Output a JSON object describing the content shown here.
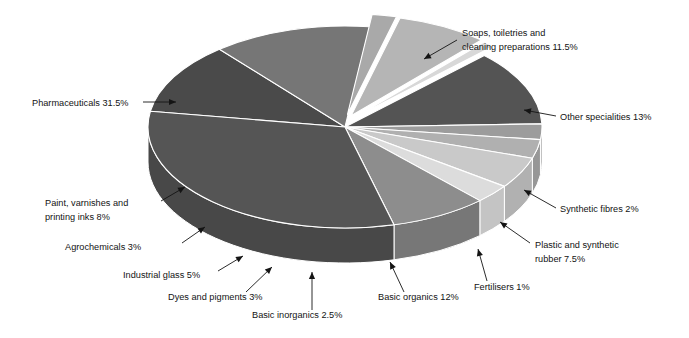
{
  "chart_data": {
    "type": "pie",
    "title": "",
    "subtitle": "",
    "xlabel": "",
    "ylabel": "",
    "style": "3d-exploded-pie",
    "legend_position": "none",
    "grid": false,
    "units": "percent",
    "total": 100,
    "categories": [
      "Soaps, toiletries and cleaning preparations",
      "Other specialities",
      "Synthetic fibres",
      "Plastic and synthetic rubber",
      "Fertilisers",
      "Basic organics",
      "Basic inorganics",
      "Dyes and pigments",
      "Industrial glass",
      "Agrochemicals",
      "Paint, varnishes and printing inks",
      "Pharmaceuticals"
    ],
    "values": [
      11.5,
      13,
      2,
      7.5,
      1,
      12,
      2.5,
      3,
      5,
      3,
      8,
      31.5
    ],
    "slices": [
      {
        "label": "Soaps, toiletries and cleaning preparations 11.5%",
        "name": "Soaps, toiletries and cleaning preparations",
        "value": 11.5,
        "value_text": "11.5%",
        "color": "#4a4a4a",
        "side_color": "#3c3c3c",
        "exploded": false
      },
      {
        "label": "Other specialities 13%",
        "name": "Other specialities",
        "value": 13,
        "value_text": "13%",
        "color": "#767676",
        "side_color": "#606060",
        "exploded": false
      },
      {
        "label": "Synthetic fibres 2%",
        "name": "Synthetic fibres",
        "value": 2,
        "value_text": "2%",
        "color": "#a9a9a9",
        "side_color": "#8e8e8e",
        "exploded": true
      },
      {
        "label": "Plastic and synthetic rubber 7.5%",
        "name": "Plastic and synthetic rubber",
        "value": 7.5,
        "value_text": "7.5%",
        "color": "#b5b5b5",
        "side_color": "#9a9a9a",
        "exploded": true
      },
      {
        "label": "Fertilisers 1%",
        "name": "Fertilisers",
        "value": 1,
        "value_text": "1%",
        "color": "#d8d8d8",
        "side_color": "#c2c2c2",
        "exploded": true
      },
      {
        "label": "Basic organics 12%",
        "name": "Basic organics",
        "value": 12,
        "value_text": "12%",
        "color": "#545454",
        "side_color": "#454545",
        "exploded": false
      },
      {
        "label": "Basic inorganics 2.5%",
        "name": "Basic inorganics",
        "value": 2.5,
        "value_text": "2.5%",
        "color": "#9c9c9c",
        "side_color": "#858585",
        "exploded": false
      },
      {
        "label": "Dyes and pigments 3%",
        "name": "Dyes and pigments",
        "value": 3,
        "value_text": "3%",
        "color": "#b0b0b0",
        "side_color": "#979797",
        "exploded": false
      },
      {
        "label": "Industrial glass 5%",
        "name": "Industrial glass",
        "value": 5,
        "value_text": "5%",
        "color": "#c9c9c9",
        "side_color": "#b1b1b1",
        "exploded": false
      },
      {
        "label": "Agrochemicals 3%",
        "name": "Agrochemicals",
        "value": 3,
        "value_text": "3%",
        "color": "#dcdcdc",
        "side_color": "#c4c4c4",
        "exploded": false
      },
      {
        "label": "Paint, varnishes and printing inks 8%",
        "name": "Paint, varnishes and printing inks",
        "value": 8,
        "value_text": "8%",
        "color": "#8d8d8d",
        "side_color": "#777777",
        "exploded": false
      },
      {
        "label": "Pharmaceuticals 31.5%",
        "name": "Pharmaceuticals",
        "value": 31.5,
        "value_text": "31.5%",
        "color": "#555555",
        "side_color": "#484848",
        "exploded": false
      }
    ]
  },
  "labels": {
    "soaps": {
      "line1": "Soaps, toiletries and",
      "line2": "cleaning preparations 11.5%"
    },
    "other_specialities": "Other specialities 13%",
    "synthetic_fibres": "Synthetic fibres 2%",
    "plastic_rubber": {
      "line1": "Plastic and synthetic",
      "line2": "rubber 7.5%"
    },
    "fertilisers": "Fertilisers 1%",
    "basic_organics": "Basic organics 12%",
    "basic_inorganics": "Basic inorganics 2.5%",
    "dyes_pigments": "Dyes and pigments 3%",
    "industrial_glass": "Industrial glass 5%",
    "agrochemicals": "Agrochemicals 3%",
    "paint_varnishes": {
      "line1": "Paint, varnishes and",
      "line2": "printing inks 8%"
    },
    "pharmaceuticals": "Pharmaceuticals 31.5%"
  },
  "colors": {
    "background": "#ffffff",
    "text": "#131313",
    "leader_line": "#141414"
  }
}
